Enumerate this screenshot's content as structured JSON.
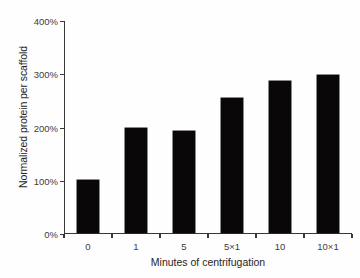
{
  "chart_data": {
    "type": "bar",
    "title": "",
    "xlabel": "Minutes of centrifugation",
    "ylabel": "Normalized protein per scaffold",
    "categories": [
      "0",
      "1",
      "5",
      "5×1",
      "10",
      "10×1"
    ],
    "values": [
      100,
      198,
      192,
      253,
      286,
      296
    ],
    "value_unit": "%",
    "ylim": [
      0,
      400
    ],
    "ytick_values": [
      0,
      100,
      200,
      300,
      400
    ],
    "ytick_labels": [
      "0%",
      "100%",
      "200%",
      "300%",
      "400%"
    ],
    "grid": false,
    "legend": null,
    "bar_color": "#0a0708",
    "axis_color": "#3b3738",
    "background_color": "#fefefe"
  }
}
